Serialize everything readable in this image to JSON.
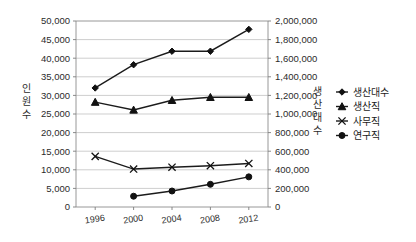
{
  "chart_data": {
    "type": "line",
    "title": "",
    "xlabel": "",
    "categories": [
      "1996",
      "2000",
      "2004",
      "2008",
      "2012"
    ],
    "grid": "horizontal",
    "legend_position": "right",
    "left_axis": {
      "label": "인원수",
      "label_chars": [
        "인",
        "원",
        "수"
      ],
      "ylim": [
        0,
        50000
      ],
      "tick_step": 5000,
      "ticks": [
        "0",
        "5,000",
        "10,000",
        "15,000",
        "20,000",
        "25,000",
        "30,000",
        "35,000",
        "40,000",
        "45,000",
        "50,000"
      ]
    },
    "right_axis": {
      "label": "생산대수",
      "label_chars": [
        "생",
        "산",
        "대",
        "수"
      ],
      "ylim": [
        0,
        2000000
      ],
      "tick_step": 200000,
      "ticks": [
        "0",
        "200,000",
        "400,000",
        "600,000",
        "800,000",
        "1,000,000",
        "1,200,000",
        "1,400,000",
        "1,600,000",
        "1,800,000",
        "2,000,000"
      ]
    },
    "series": [
      {
        "name": "생산대수",
        "axis": "right",
        "marker": "diamond",
        "values": [
          1280000,
          1530000,
          1675000,
          1675000,
          1910000
        ]
      },
      {
        "name": "생산직",
        "axis": "left",
        "marker": "triangle",
        "values": [
          28200,
          26100,
          28700,
          29500,
          29500
        ]
      },
      {
        "name": "사무직",
        "axis": "left",
        "marker": "x",
        "values": [
          13600,
          10200,
          10700,
          11100,
          11700
        ]
      },
      {
        "name": "연구직",
        "axis": "left",
        "marker": "circle",
        "values": [
          null,
          2900,
          4300,
          6100,
          8100
        ]
      }
    ]
  },
  "legend": {
    "items": [
      {
        "label": "생산대수",
        "marker": "diamond"
      },
      {
        "label": "생산직",
        "marker": "triangle"
      },
      {
        "label": "사무직",
        "marker": "x"
      },
      {
        "label": "연구직",
        "marker": "circle"
      }
    ]
  },
  "colors": {
    "series": "#111111",
    "grid": "#b9b9b9",
    "frame": "#8c8c8c",
    "text": "#1a1a1a",
    "background": "#ffffff"
  }
}
